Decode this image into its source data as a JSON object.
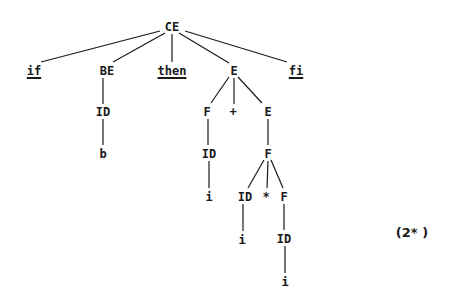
{
  "diagram": {
    "type": "parse-tree",
    "equation_label": "(2* )",
    "edge_color": "#1a1a1a",
    "nodes": [
      {
        "id": "n0",
        "text": "CE",
        "x": 172,
        "y": 27,
        "keyword": false
      },
      {
        "id": "n1",
        "text": "if",
        "x": 34,
        "y": 71,
        "keyword": true
      },
      {
        "id": "n2",
        "text": "BE",
        "x": 107,
        "y": 71,
        "keyword": false
      },
      {
        "id": "n3",
        "text": "then",
        "x": 172,
        "y": 71,
        "keyword": true
      },
      {
        "id": "n4",
        "text": "E",
        "x": 234,
        "y": 71,
        "keyword": false
      },
      {
        "id": "n5",
        "text": "fi",
        "x": 296,
        "y": 71,
        "keyword": true
      },
      {
        "id": "n6",
        "text": "ID",
        "x": 103,
        "y": 112,
        "keyword": false
      },
      {
        "id": "n7",
        "text": "b",
        "x": 103,
        "y": 154,
        "keyword": false
      },
      {
        "id": "n8",
        "text": "F",
        "x": 207,
        "y": 112,
        "keyword": false
      },
      {
        "id": "n9",
        "text": "+",
        "x": 233,
        "y": 112,
        "keyword": false
      },
      {
        "id": "n10",
        "text": "E",
        "x": 268,
        "y": 112,
        "keyword": false
      },
      {
        "id": "n11",
        "text": "ID",
        "x": 209,
        "y": 154,
        "keyword": false
      },
      {
        "id": "n12",
        "text": "F",
        "x": 268,
        "y": 154,
        "keyword": false
      },
      {
        "id": "n13",
        "text": "i",
        "x": 209,
        "y": 197,
        "keyword": false
      },
      {
        "id": "n14",
        "text": "ID",
        "x": 245,
        "y": 197,
        "keyword": false
      },
      {
        "id": "n15",
        "text": "*",
        "x": 266,
        "y": 197,
        "keyword": false
      },
      {
        "id": "n16",
        "text": "F",
        "x": 284,
        "y": 197,
        "keyword": false
      },
      {
        "id": "n17",
        "text": "i",
        "x": 242,
        "y": 240,
        "keyword": false
      },
      {
        "id": "n18",
        "text": "ID",
        "x": 284,
        "y": 239,
        "keyword": false
      },
      {
        "id": "n19",
        "text": "i",
        "x": 285,
        "y": 282,
        "keyword": false
      }
    ],
    "edges": [
      {
        "x1": 160,
        "y1": 31,
        "x2": 41,
        "y2": 62
      },
      {
        "x1": 165,
        "y1": 33,
        "x2": 113,
        "y2": 62
      },
      {
        "x1": 172,
        "y1": 34,
        "x2": 172,
        "y2": 62
      },
      {
        "x1": 179,
        "y1": 33,
        "x2": 229,
        "y2": 63
      },
      {
        "x1": 185,
        "y1": 31,
        "x2": 287,
        "y2": 62
      },
      {
        "x1": 103,
        "y1": 78,
        "x2": 103,
        "y2": 104
      },
      {
        "x1": 103,
        "y1": 119,
        "x2": 103,
        "y2": 145
      },
      {
        "x1": 229,
        "y1": 77,
        "x2": 211,
        "y2": 103
      },
      {
        "x1": 234,
        "y1": 78,
        "x2": 234,
        "y2": 104
      },
      {
        "x1": 238,
        "y1": 77,
        "x2": 262,
        "y2": 103
      },
      {
        "x1": 208,
        "y1": 119,
        "x2": 208,
        "y2": 145
      },
      {
        "x1": 268,
        "y1": 119,
        "x2": 268,
        "y2": 145
      },
      {
        "x1": 209,
        "y1": 161,
        "x2": 209,
        "y2": 188
      },
      {
        "x1": 264,
        "y1": 160,
        "x2": 248,
        "y2": 188
      },
      {
        "x1": 268,
        "y1": 161,
        "x2": 267,
        "y2": 188
      },
      {
        "x1": 271,
        "y1": 160,
        "x2": 283,
        "y2": 188
      },
      {
        "x1": 243,
        "y1": 204,
        "x2": 243,
        "y2": 231
      },
      {
        "x1": 284,
        "y1": 204,
        "x2": 284,
        "y2": 230
      },
      {
        "x1": 285,
        "y1": 246,
        "x2": 285,
        "y2": 273
      }
    ]
  }
}
